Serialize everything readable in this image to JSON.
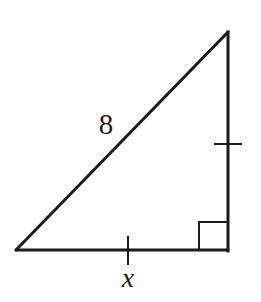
{
  "diagram": {
    "type": "right-triangle",
    "colors": {
      "stroke": "#1a1a1a",
      "background": "#ffffff"
    },
    "vertices": {
      "top": [
        228,
        32
      ],
      "bottom_left": [
        16,
        250
      ],
      "right_angle": [
        228,
        250
      ]
    },
    "right_angle_marker": {
      "size": 29
    },
    "sides": {
      "hypotenuse": {
        "label": "8"
      },
      "base": {
        "label": "x",
        "tick_marks": 1
      },
      "vertical_leg": {
        "label": "",
        "tick_marks": 1
      }
    },
    "labels": {
      "hypotenuse": "8",
      "base": "x"
    }
  }
}
